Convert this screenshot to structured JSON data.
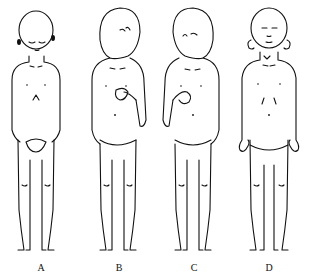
{
  "diagram": {
    "type": "figure-panel",
    "figures": [
      {
        "id": "A",
        "label": "A",
        "description": "child standing, head bowed, eyes closed, hands clasped in front of groin"
      },
      {
        "id": "B",
        "label": "B",
        "description": "child standing, head turned and tilted to right, right hand held to chest"
      },
      {
        "id": "C",
        "label": "C",
        "description": "child standing, head turned and tilted to left, right hand held to chest"
      },
      {
        "id": "D",
        "label": "D",
        "description": "child standing upright, arms at sides with flexed clawed hands, prominent ears"
      }
    ],
    "colors": {
      "stroke": "#111111",
      "background": "#ffffff"
    }
  }
}
